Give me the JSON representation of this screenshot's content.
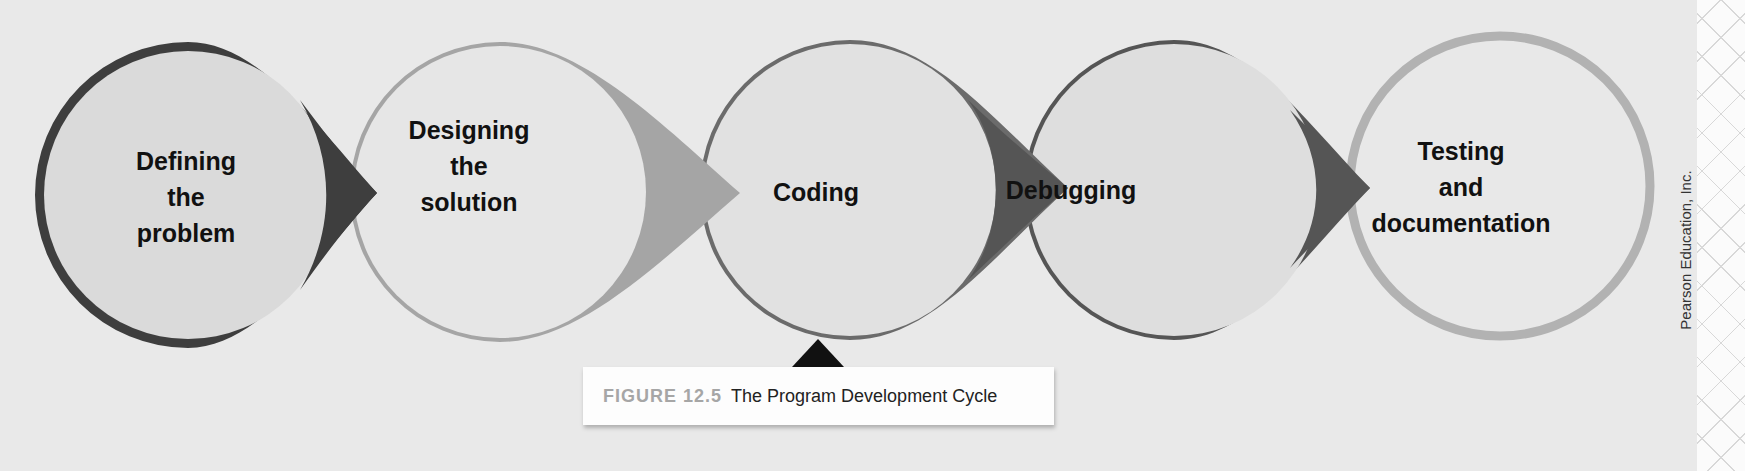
{
  "figure": {
    "number_label": "FIGURE 12.5",
    "title": "The Program Development Cycle",
    "credit": "Pearson Education, Inc."
  },
  "steps": [
    {
      "label": "Defining\nthe\nproblem",
      "stroke": "#3e3e3e",
      "fill": "#dadada"
    },
    {
      "label": "Designing\nthe\nsolution",
      "stroke": "#a5a5a5",
      "fill": "#e6e6e6"
    },
    {
      "label": "Coding",
      "stroke": "#6b6b6b",
      "fill": "#e1e1e1"
    },
    {
      "label": "Debugging",
      "stroke": "#555555",
      "fill": "#dedede"
    },
    {
      "label": "Testing\nand\ndocumentation",
      "stroke": "#b2b2b2",
      "fill": "#e8e8e8"
    }
  ],
  "colors": {
    "background": "#e9e9e9",
    "pointer": "#111111"
  }
}
